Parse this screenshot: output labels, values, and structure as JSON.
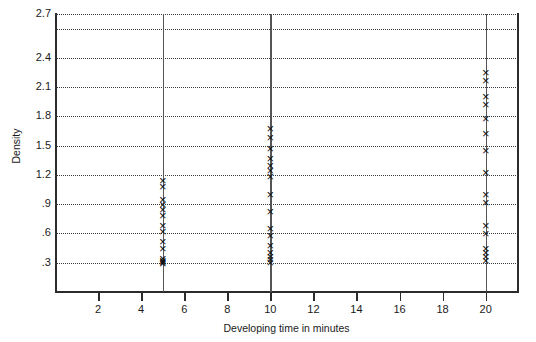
{
  "chart_data": {
    "type": "scatter",
    "title": "",
    "xlabel": "Developing time in minutes",
    "ylabel": "Density",
    "xlim": [
      0,
      21.5
    ],
    "ylim": [
      0,
      2.85
    ],
    "grid": "horizontal-dotted",
    "legend": "none",
    "xticks": [
      2,
      4,
      6,
      8,
      10,
      12,
      14,
      16,
      18,
      20
    ],
    "xtick_labels": [
      "2",
      "4",
      "6",
      "8",
      "10",
      "12",
      "14",
      "16",
      "18",
      "20"
    ],
    "yticks": [
      0.3,
      0.6,
      0.9,
      1.2,
      1.5,
      1.8,
      2.1,
      2.4,
      2.7
    ],
    "ytick_labels": [
      ".3",
      ".6",
      ".9",
      "1.2",
      "1.5",
      "1.8",
      "2.1",
      "2.4",
      "2.7"
    ],
    "vertical_reference_lines": [
      5,
      10,
      20
    ],
    "groups": [
      {
        "x": 5,
        "values": [
          0.29,
          0.3,
          0.31,
          0.32,
          0.34,
          0.45,
          0.52,
          0.62,
          0.68,
          0.78,
          0.85,
          0.9,
          0.95,
          1.08,
          1.14
        ]
      },
      {
        "x": 10,
        "values": [
          0.3,
          0.33,
          0.36,
          0.4,
          0.48,
          0.58,
          0.65,
          0.83,
          1.0,
          1.18,
          1.25,
          1.3,
          1.37,
          1.47,
          1.58,
          1.68
        ]
      },
      {
        "x": 20,
        "values": [
          0.32,
          0.36,
          0.4,
          0.45,
          0.6,
          0.68,
          0.92,
          1.0,
          1.22,
          1.45,
          1.62,
          1.78,
          1.92,
          2.0,
          2.17,
          2.25
        ]
      }
    ],
    "marker_symbol": "x-cross"
  }
}
